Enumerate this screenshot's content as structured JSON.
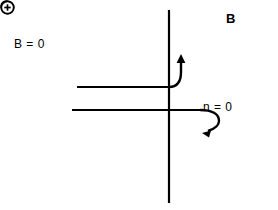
{
  "figure": {
    "background_color": "#ffffff",
    "stroke_color": "#000000",
    "width": 278,
    "height": 210
  },
  "labels": {
    "b_zero": "B = 0",
    "n_zero": "n = 0",
    "b_field": "B",
    "field_direction_icon": "circle-dot-out-of-page-icon"
  },
  "charges": {
    "negative": {
      "symbol": "⊖",
      "name": "negative-charge-symbol"
    },
    "positive": {
      "symbol": "⊕",
      "name": "positive-charge-symbol"
    }
  },
  "geometry": {
    "vertical_axis": {
      "x": 169,
      "y1": 10,
      "y2": 203
    },
    "upper_beam_line": {
      "x1": 77,
      "x2": 169,
      "y": 87
    },
    "lower_beam_line": {
      "x1": 72,
      "x2": 200,
      "y": 110
    },
    "negative_arrow": "curve up-right from upper beam end to negative charge",
    "positive_arrow": "curve right then down from lower beam end to positive charge"
  }
}
